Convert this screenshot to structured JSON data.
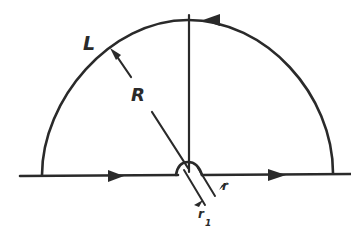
{
  "diagram": {
    "type": "contour-integral",
    "labels": {
      "contour": "L",
      "large_radius": "R",
      "small_radius": "r",
      "small_radius_sub": "r",
      "small_radius_sub_index": "1"
    },
    "arrows": {
      "real_axis": "right",
      "arc_top": "left"
    },
    "colors": {
      "stroke": "#2a2a2a",
      "background": "#ffffff"
    }
  }
}
